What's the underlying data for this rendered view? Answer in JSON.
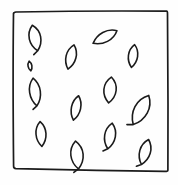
{
  "drawing": {
    "title": "Scattered leaf shapes inside a hand-drawn square",
    "medium": "pen-and-ink line sketch",
    "background_color": "#fefefe",
    "ink_color": "#1b1b1b",
    "canvas": {
      "width": 178,
      "height": 185
    },
    "frame": {
      "name": "hand-drawn square border",
      "stroke_color": "#1b1b1b",
      "stroke_width": 1.7,
      "closed": true,
      "corners": [
        {
          "x": 13,
          "y": 13
        },
        {
          "x": 167,
          "y": 11
        },
        {
          "x": 168,
          "y": 171
        },
        {
          "x": 14,
          "y": 168
        }
      ],
      "path": "M13.5,13.5 C13.2,13.2 14.5,12.2 16,12.0 C60,11.2 120,10.8 166.5,11.2 C167.4,11.3 167.6,12.2 167.5,14 C167.9,60 168.2,120 167.9,170.2 C167.8,171.3 166.6,171.6 164.5,171.4 C118,170.8 60,169.8 16,168.6 C14.2,168.5 13.5,167.8 13.6,166 C13.1,118 12.9,60 13.5,13.5 Z"
    },
    "leaf_count": 13,
    "leaves": [
      {
        "id": 1,
        "name": "leaf-top-left",
        "cx": 35,
        "cy": 38,
        "length": 26,
        "width": 15,
        "rotation": -12,
        "has_tail": true,
        "tail_side": "bottom"
      },
      {
        "id": 2,
        "name": "leaf-top-center-left",
        "cx": 71,
        "cy": 57,
        "length": 25,
        "width": 13,
        "rotation": 14,
        "has_tail": false,
        "tail_side": "bottom"
      },
      {
        "id": 3,
        "name": "leaf-top-center-tilted",
        "cx": 105,
        "cy": 37,
        "length": 27,
        "width": 13,
        "rotation": 62,
        "has_tail": false,
        "tail_side": "bottom"
      },
      {
        "id": 4,
        "name": "leaf-top-right",
        "cx": 133,
        "cy": 56,
        "length": 23,
        "width": 12,
        "rotation": 8,
        "has_tail": false,
        "tail_side": "bottom"
      },
      {
        "id": 5,
        "name": "leaf-middle-left",
        "cx": 35,
        "cy": 92,
        "length": 28,
        "width": 14,
        "rotation": -8,
        "has_tail": true,
        "tail_side": "bottom"
      },
      {
        "id": 6,
        "name": "leaf-middle-right-upper",
        "cx": 110,
        "cy": 90,
        "length": 26,
        "width": 16,
        "rotation": 6,
        "has_tail": false,
        "tail_side": "top"
      },
      {
        "id": 7,
        "name": "leaf-center",
        "cx": 76,
        "cy": 108,
        "length": 25,
        "width": 12,
        "rotation": 12,
        "has_tail": false,
        "tail_side": "bottom"
      },
      {
        "id": 8,
        "name": "leaf-right-large",
        "cx": 141,
        "cy": 110,
        "length": 33,
        "width": 18,
        "rotation": 28,
        "has_tail": true,
        "tail_side": "bottom"
      },
      {
        "id": 9,
        "name": "leaf-lower-left",
        "cx": 41,
        "cy": 134,
        "length": 25,
        "width": 13,
        "rotation": -4,
        "has_tail": false,
        "tail_side": "bottom"
      },
      {
        "id": 10,
        "name": "leaf-lower-center-right",
        "cx": 110,
        "cy": 136,
        "length": 26,
        "width": 14,
        "rotation": 10,
        "has_tail": true,
        "tail_side": "bottom"
      },
      {
        "id": 11,
        "name": "leaf-bottom-center",
        "cx": 77,
        "cy": 155,
        "length": 28,
        "width": 16,
        "rotation": -6,
        "has_tail": true,
        "tail_side": "bottom"
      },
      {
        "id": 12,
        "name": "leaf-bottom-right",
        "cx": 145,
        "cy": 152,
        "length": 26,
        "width": 14,
        "rotation": 16,
        "has_tail": true,
        "tail_side": "bottom"
      },
      {
        "id": 13,
        "name": "leaf-left-lower-edge",
        "cx": 30,
        "cy": 66,
        "length": 10,
        "width": 5,
        "rotation": -10,
        "has_tail": false,
        "tail_side": "bottom"
      }
    ]
  }
}
